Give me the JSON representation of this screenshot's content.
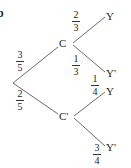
{
  "diagram": {
    "type": "probability-tree",
    "part_label": "b",
    "root": {
      "x": 13,
      "y": 83
    },
    "level1": [
      {
        "id": "C",
        "label": "C",
        "x": 63,
        "y": 44,
        "prob": {
          "num": "3",
          "den": "5"
        }
      },
      {
        "id": "Cp",
        "label": "C'",
        "x": 63,
        "y": 117,
        "prob": {
          "num": "2",
          "den": "5"
        }
      }
    ],
    "level2": {
      "C": [
        {
          "label": "Y",
          "x": 107,
          "y": 16,
          "prob": {
            "num": "2",
            "den": "3"
          }
        },
        {
          "label": "Y'",
          "x": 107,
          "y": 72,
          "prob": {
            "num": "1",
            "den": "3"
          }
        }
      ],
      "Cp": [
        {
          "label": "Y",
          "x": 107,
          "y": 92,
          "prob": {
            "num": "1",
            "den": "4"
          }
        },
        {
          "label": "Y'",
          "x": 107,
          "y": 146,
          "prob": {
            "num": "3",
            "den": "4"
          }
        }
      ]
    },
    "colors": {
      "line": "#444444",
      "text": "#222222",
      "background": "#ffffff"
    }
  }
}
